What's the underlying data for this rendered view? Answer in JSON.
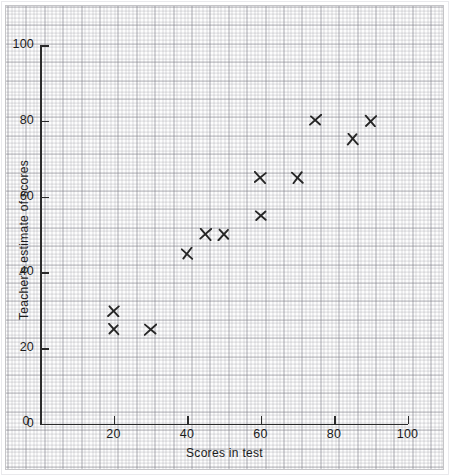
{
  "chart_data": {
    "type": "scatter",
    "title": "",
    "xlabel": "Scores in test",
    "ylabel": "Teacher's estimate of scores",
    "xlim": [
      0,
      110
    ],
    "ylim": [
      0,
      105
    ],
    "xticks": [
      0,
      20,
      40,
      60,
      80,
      100
    ],
    "yticks": [
      0,
      20,
      40,
      60,
      80,
      100
    ],
    "xtick_labels": [
      "0",
      "20",
      "40",
      "60",
      "80",
      "100"
    ],
    "ytick_labels": [
      "0",
      "20",
      "40",
      "60",
      "80",
      "100"
    ],
    "grid": "graph-paper 2mm minor / 10mm major",
    "legend": "none",
    "marker": "x-cross",
    "marker_color": "#262626",
    "points": [
      {
        "x": 20,
        "y": 30
      },
      {
        "x": 20,
        "y": 25
      },
      {
        "x": 30,
        "y": 25
      },
      {
        "x": 40,
        "y": 45
      },
      {
        "x": 45,
        "y": 50
      },
      {
        "x": 50,
        "y": 50
      },
      {
        "x": 60,
        "y": 55
      },
      {
        "x": 60,
        "y": 65
      },
      {
        "x": 70,
        "y": 65
      },
      {
        "x": 75,
        "y": 80
      },
      {
        "x": 85,
        "y": 75
      },
      {
        "x": 90,
        "y": 80
      }
    ]
  },
  "axes": {
    "x_title": "Scores in test",
    "y_title": "Teacher's estimate of scores",
    "x_labels": [
      "0",
      "20",
      "40",
      "60",
      "80",
      "100"
    ],
    "y_labels": [
      "0",
      "20",
      "40",
      "60",
      "80",
      "100"
    ]
  },
  "colors": {
    "axis": "#2b2b2b",
    "marker": "#262626",
    "grid_minor": "rgba(140,140,150,0.30)",
    "grid_major": "rgba(120,120,130,0.42)",
    "paper": "#fdfdfd"
  }
}
